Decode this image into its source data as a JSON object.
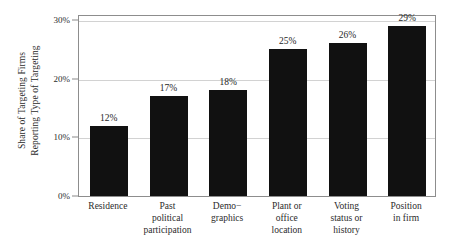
{
  "chart_data": {
    "type": "bar",
    "title": "",
    "subtitle": "",
    "xlabel": "",
    "ylabel": "Share of Targeting Firms Reporting Type of Targeting",
    "ylabel_lines": [
      "Share of Targeting Firms",
      "Reporting Type of Targeting"
    ],
    "ylim": [
      0,
      30
    ],
    "y_ticks": [
      0,
      10,
      20,
      30
    ],
    "y_tick_labels": [
      "0%",
      "10%",
      "20%",
      "30%"
    ],
    "grid": true,
    "grid_axis": "y",
    "legend": false,
    "legend_position": "none",
    "bar_color": "#111111",
    "grid_color": "#d2d2d2",
    "frame_color": "#8d8d8d",
    "text_color": "#2b2b2b",
    "categories": [
      "Residence",
      "Past political participation",
      "Demo−graphics",
      "Plant or office location",
      "Voting status or history",
      "Position in firm"
    ],
    "category_label_lines": [
      [
        "Residence"
      ],
      [
        "Past",
        "political",
        "participation"
      ],
      [
        "Demo−",
        "graphics"
      ],
      [
        "Plant or",
        "office",
        "location"
      ],
      [
        "Voting",
        "status or",
        "history"
      ],
      [
        "Position",
        "in firm"
      ]
    ],
    "values": [
      12,
      17,
      18,
      25,
      26,
      29
    ],
    "value_labels": [
      "12%",
      "17%",
      "18%",
      "25%",
      "26%",
      "29%"
    ]
  }
}
